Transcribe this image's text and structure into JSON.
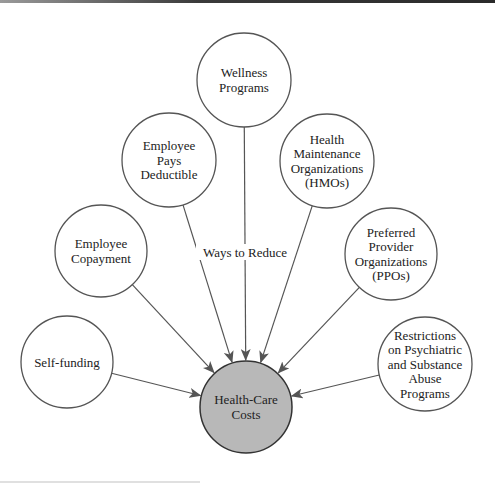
{
  "diagram": {
    "type": "hub-and-spoke concept map",
    "edge_label": "Ways to Reduce",
    "center": {
      "id": "health-care-costs",
      "lines": [
        "Health-Care",
        "Costs"
      ],
      "cx": 246,
      "cy": 407,
      "r": 46,
      "fill": "#b8b8b8"
    },
    "nodes": [
      {
        "id": "self-funding",
        "lines": [
          "Self-funding"
        ],
        "cx": 67,
        "cy": 362,
        "r": 46
      },
      {
        "id": "employee-copayment",
        "lines": [
          "Employee",
          "Copayment"
        ],
        "cx": 101,
        "cy": 251,
        "r": 46
      },
      {
        "id": "employee-pays-deductible",
        "lines": [
          "Employee",
          "Pays",
          "Deductible"
        ],
        "cx": 169,
        "cy": 160,
        "r": 47
      },
      {
        "id": "wellness-programs",
        "lines": [
          "Wellness",
          "Programs"
        ],
        "cx": 244,
        "cy": 80,
        "r": 47
      },
      {
        "id": "hmos",
        "lines": [
          "Health",
          "Maintenance",
          "Organizations",
          "(HMOs)"
        ],
        "cx": 327,
        "cy": 161,
        "r": 47
      },
      {
        "id": "ppos",
        "lines": [
          "Preferred",
          "Provider",
          "Organizations",
          "(PPOs)"
        ],
        "cx": 391,
        "cy": 254,
        "r": 46
      },
      {
        "id": "restrictions",
        "lines": [
          "Restrictions",
          "on Psychiatric",
          "and Substance",
          "Abuse",
          "Programs"
        ],
        "cx": 425,
        "cy": 364,
        "r": 47
      }
    ],
    "edges": [
      {
        "from": "self-funding",
        "to": "health-care-costs"
      },
      {
        "from": "employee-copayment",
        "to": "health-care-costs"
      },
      {
        "from": "employee-pays-deductible",
        "to": "health-care-costs"
      },
      {
        "from": "wellness-programs",
        "to": "health-care-costs",
        "label": "Ways to Reduce"
      },
      {
        "from": "hmos",
        "to": "health-care-costs"
      },
      {
        "from": "ppos",
        "to": "health-care-costs"
      },
      {
        "from": "restrictions",
        "to": "health-care-costs"
      }
    ],
    "colors": {
      "stroke": "#555555",
      "center_fill": "#b8b8b8",
      "background": "#ffffff"
    }
  }
}
